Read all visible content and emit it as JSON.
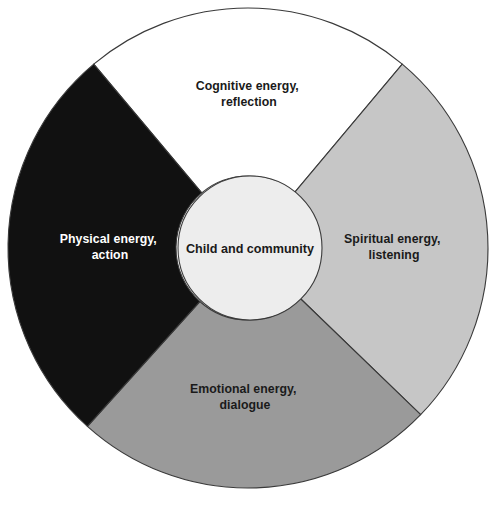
{
  "diagram": {
    "type": "donut-wheel",
    "background_color": "#ffffff",
    "outline_color": "#3a3a3a",
    "center": {
      "x": 248,
      "y": 248
    },
    "outer_radius": 240,
    "inner_radius": 72,
    "hub": {
      "label_line1": "Child and community",
      "fill_color": "#ededed",
      "text_color": "#1a1a1a"
    },
    "segments": [
      {
        "id": "cognitive",
        "position": "top",
        "label_line1": "Cognitive energy,",
        "label_line2": "reflection",
        "fill_color": "#ffffff",
        "text_color": "#1a1a1a",
        "start_angle": -130,
        "end_angle": -50,
        "label_x": 249,
        "label_y": 90
      },
      {
        "id": "spiritual",
        "position": "right",
        "label_line1": "Spiritual energy,",
        "label_line2": "listening",
        "fill_color": "#c6c6c6",
        "text_color": "#1a1a1a",
        "start_angle": -50,
        "end_angle": 44,
        "label_x": 394,
        "label_y": 243
      },
      {
        "id": "emotional",
        "position": "bottom",
        "label_line1": "Emotional energy,",
        "label_line2": "dialogue",
        "fill_color": "#9a9a9a",
        "text_color": "#1a1a1a",
        "start_angle": 44,
        "end_angle": 132,
        "label_x": 245,
        "label_y": 393
      },
      {
        "id": "physical",
        "position": "left",
        "label_line1": "Physical energy,",
        "label_line2": "action",
        "fill_color": "#111111",
        "text_color": "#ffffff",
        "start_angle": 132,
        "end_angle": 230,
        "label_x": 110,
        "label_y": 243
      }
    ]
  },
  "chart_data": {
    "type": "pie",
    "title": "",
    "categories": [
      "Cognitive energy, reflection",
      "Spiritual energy, listening",
      "Emotional energy, dialogue",
      "Physical energy, action"
    ],
    "values": [
      80,
      94,
      88,
      98
    ],
    "value_unit": "degrees of arc",
    "center_label": "Child and community",
    "colors": [
      "#ffffff",
      "#c6c6c6",
      "#9a9a9a",
      "#111111"
    ],
    "legend": "none",
    "grid": false
  }
}
